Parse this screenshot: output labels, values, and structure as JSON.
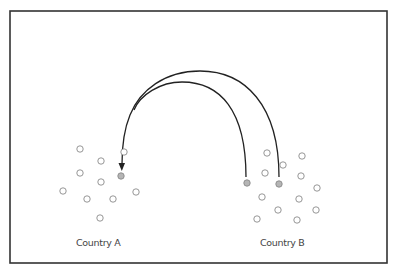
{
  "diagram": {
    "frame": {
      "x": 10,
      "y": 11,
      "width": 377,
      "height": 252,
      "stroke": "#333333"
    },
    "labels": {
      "country_a": "Country A",
      "country_b": "Country B"
    },
    "colors": {
      "circle_stroke": "#8a8a8a",
      "circle_fill_highlight": "#b5b5b5",
      "arc": "#222222"
    },
    "country_a": {
      "circles": [
        {
          "x": 80,
          "y": 149,
          "filled": false
        },
        {
          "x": 101,
          "y": 161,
          "filled": false
        },
        {
          "x": 124,
          "y": 152,
          "filled": false
        },
        {
          "x": 80,
          "y": 173,
          "filled": false
        },
        {
          "x": 101,
          "y": 182,
          "filled": false
        },
        {
          "x": 121,
          "y": 176,
          "filled": true
        },
        {
          "x": 63,
          "y": 191,
          "filled": false
        },
        {
          "x": 87,
          "y": 199,
          "filled": false
        },
        {
          "x": 113,
          "y": 199,
          "filled": false
        },
        {
          "x": 136,
          "y": 192,
          "filled": false
        },
        {
          "x": 100,
          "y": 218,
          "filled": false
        }
      ]
    },
    "country_b": {
      "circles": [
        {
          "x": 267,
          "y": 153,
          "filled": false
        },
        {
          "x": 302,
          "y": 156,
          "filled": false
        },
        {
          "x": 283,
          "y": 165,
          "filled": false
        },
        {
          "x": 265,
          "y": 173,
          "filled": false
        },
        {
          "x": 301,
          "y": 176,
          "filled": false
        },
        {
          "x": 247,
          "y": 183,
          "filled": true
        },
        {
          "x": 279,
          "y": 184,
          "filled": true
        },
        {
          "x": 317,
          "y": 188,
          "filled": false
        },
        {
          "x": 262,
          "y": 197,
          "filled": false
        },
        {
          "x": 299,
          "y": 199,
          "filled": false
        },
        {
          "x": 278,
          "y": 210,
          "filled": false
        },
        {
          "x": 316,
          "y": 210,
          "filled": false
        },
        {
          "x": 257,
          "y": 219,
          "filled": false
        },
        {
          "x": 297,
          "y": 220,
          "filled": false
        }
      ]
    },
    "arcs": [
      {
        "name": "inner-migration-arc",
        "from": [
          246,
          177
        ],
        "to": [
          121,
          169
        ],
        "peak_y": 82
      },
      {
        "name": "outer-migration-arc",
        "from": [
          279,
          177
        ],
        "to": [
          121,
          169
        ],
        "peak_y": 71
      }
    ]
  }
}
